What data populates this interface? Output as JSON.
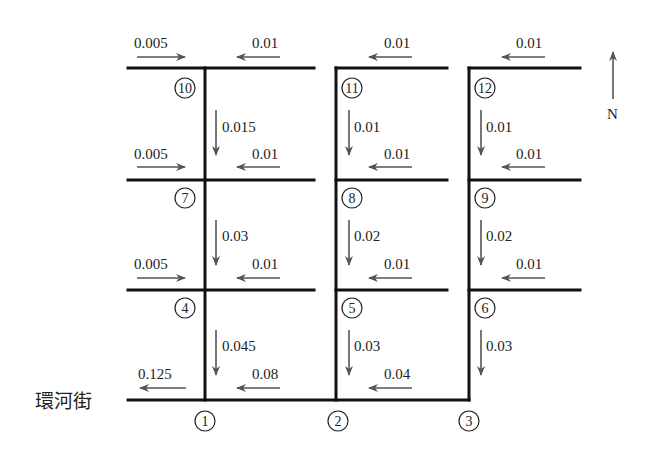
{
  "street_name": "環河街",
  "north_label": "N",
  "nodes": [
    "1",
    "2",
    "3",
    "4",
    "5",
    "6",
    "7",
    "8",
    "9",
    "10",
    "11",
    "12"
  ],
  "flows": {
    "h_top_w1_in": "0.005",
    "h_top_e1": "0.01",
    "h_top_e2": "0.01",
    "h_top_e3": "0.01",
    "v_10_7": "0.015",
    "v_11_8": "0.01",
    "v_12_9": "0.01",
    "h_r2_w1_in": "0.005",
    "h_r2_e1": "0.01",
    "h_r2_e2": "0.01",
    "h_r2_e3": "0.01",
    "v_7_4": "0.03",
    "v_8_5": "0.02",
    "v_9_6": "0.02",
    "h_r3_w1_in": "0.005",
    "h_r3_e1": "0.01",
    "h_r3_e2": "0.01",
    "h_r3_e3": "0.01",
    "v_4_1": "0.045",
    "v_5_2": "0.03",
    "v_6_3": "0.03",
    "h_bot_out": "0.125",
    "h_bot_1_2": "0.08",
    "h_bot_2_3": "0.04"
  }
}
